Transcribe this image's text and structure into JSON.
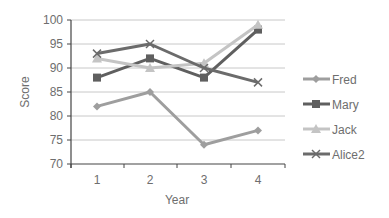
{
  "chart_data": {
    "type": "line",
    "title": "",
    "xlabel": "Year",
    "ylabel": "Score",
    "x": [
      1,
      2,
      3,
      4
    ],
    "x_tick_labels": [
      "1",
      "2",
      "3",
      "4"
    ],
    "y_tick_labels": [
      "70",
      "75",
      "80",
      "85",
      "90",
      "95",
      "100"
    ],
    "ylim": [
      70,
      100
    ],
    "y_ticks": [
      70,
      75,
      80,
      85,
      90,
      95,
      100
    ],
    "grid": "horizontal",
    "legend_position": "right",
    "series": [
      {
        "name": "Fred",
        "values": [
          82,
          85,
          74,
          77
        ],
        "color": "#9e9e9e",
        "marker": "diamond"
      },
      {
        "name": "Mary",
        "values": [
          88,
          92,
          88,
          98
        ],
        "color": "#5f5f5f",
        "marker": "square"
      },
      {
        "name": "Jack",
        "values": [
          92,
          90,
          91,
          99
        ],
        "color": "#c4c4c4",
        "marker": "triangle"
      },
      {
        "name": "Alice2",
        "values": [
          93,
          95,
          90,
          87
        ],
        "color": "#6b6b6b",
        "marker": "x"
      }
    ]
  }
}
